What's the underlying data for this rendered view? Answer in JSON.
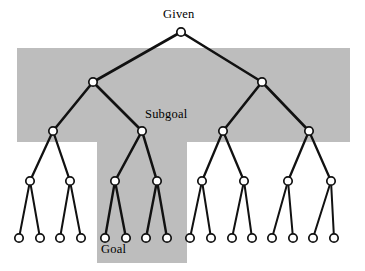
{
  "figure": {
    "title_alt": "Problem space search tree with Given, Subgoal and Goal highlighted",
    "width": 365,
    "height": 271,
    "background_color": "#ffffff"
  },
  "colors": {
    "highlight_fill": "#bdbdbd",
    "line": "#111111",
    "node_fill": "#ffffff",
    "node_stroke": "#111111",
    "text": "#000000"
  },
  "labels": {
    "given": "Given",
    "subgoal": "Subgoal",
    "goal": "Goal"
  },
  "highlight_regions": [
    {
      "name": "upper-band",
      "x": 17,
      "y": 48,
      "width": 333,
      "height": 94
    },
    {
      "name": "goal-column",
      "x": 97,
      "y": 142,
      "width": 90,
      "height": 121
    }
  ],
  "chart_data": {
    "type": "diagram",
    "diagram_kind": "binary-tree",
    "depth": 5,
    "node_counts_by_level": [
      1,
      2,
      4,
      8,
      16
    ],
    "node_radius": 4.2,
    "levels_y": [
      32,
      82,
      131,
      181,
      238
    ],
    "nodes": [
      {
        "id": "n0",
        "level": 0,
        "x": 181,
        "y": 32,
        "label": "Given",
        "highlight": false
      },
      {
        "id": "n1-0",
        "level": 1,
        "x": 93,
        "y": 82,
        "label": "",
        "highlight": false
      },
      {
        "id": "n1-1",
        "level": 1,
        "x": 262,
        "y": 82,
        "label": "",
        "highlight": false
      },
      {
        "id": "n2-0",
        "level": 2,
        "x": 53,
        "y": 131,
        "label": "",
        "highlight": false
      },
      {
        "id": "n2-1",
        "level": 2,
        "x": 142,
        "y": 131,
        "label": "Subgoal",
        "highlight": true
      },
      {
        "id": "n2-2",
        "level": 2,
        "x": 223,
        "y": 131,
        "label": "",
        "highlight": false
      },
      {
        "id": "n2-3",
        "level": 2,
        "x": 309,
        "y": 131,
        "label": "",
        "highlight": false
      },
      {
        "id": "n3-0",
        "level": 3,
        "x": 30,
        "y": 181,
        "label": "",
        "highlight": false
      },
      {
        "id": "n3-1",
        "level": 3,
        "x": 70,
        "y": 181,
        "label": "",
        "highlight": false
      },
      {
        "id": "n3-2",
        "level": 3,
        "x": 115,
        "y": 181,
        "label": "",
        "highlight": true
      },
      {
        "id": "n3-3",
        "level": 3,
        "x": 157,
        "y": 181,
        "label": "",
        "highlight": true
      },
      {
        "id": "n3-4",
        "level": 3,
        "x": 202,
        "y": 181,
        "label": "",
        "highlight": false
      },
      {
        "id": "n3-5",
        "level": 3,
        "x": 244,
        "y": 181,
        "label": "",
        "highlight": false
      },
      {
        "id": "n3-6",
        "level": 3,
        "x": 288,
        "y": 181,
        "label": "",
        "highlight": false
      },
      {
        "id": "n3-7",
        "level": 3,
        "x": 331,
        "y": 181,
        "label": "",
        "highlight": false
      },
      {
        "id": "n4-0",
        "level": 4,
        "x": 19,
        "y": 238,
        "label": "",
        "highlight": false
      },
      {
        "id": "n4-1",
        "level": 4,
        "x": 40,
        "y": 238,
        "label": "",
        "highlight": false
      },
      {
        "id": "n4-2",
        "level": 4,
        "x": 60,
        "y": 238,
        "label": "",
        "highlight": false
      },
      {
        "id": "n4-3",
        "level": 4,
        "x": 81,
        "y": 238,
        "label": "",
        "highlight": false
      },
      {
        "id": "n4-4",
        "level": 4,
        "x": 105,
        "y": 238,
        "label": "Goal",
        "highlight": true
      },
      {
        "id": "n4-5",
        "level": 4,
        "x": 126,
        "y": 238,
        "label": "",
        "highlight": true
      },
      {
        "id": "n4-6",
        "level": 4,
        "x": 146,
        "y": 238,
        "label": "",
        "highlight": true
      },
      {
        "id": "n4-7",
        "level": 4,
        "x": 167,
        "y": 238,
        "label": "",
        "highlight": true
      },
      {
        "id": "n4-8",
        "level": 4,
        "x": 190,
        "y": 238,
        "label": "",
        "highlight": false
      },
      {
        "id": "n4-9",
        "level": 4,
        "x": 211,
        "y": 238,
        "label": "",
        "highlight": false
      },
      {
        "id": "n4-10",
        "level": 4,
        "x": 232,
        "y": 238,
        "label": "",
        "highlight": false
      },
      {
        "id": "n4-11",
        "level": 4,
        "x": 252,
        "y": 238,
        "label": "",
        "highlight": false
      },
      {
        "id": "n4-12",
        "level": 4,
        "x": 272,
        "y": 238,
        "label": "",
        "highlight": false
      },
      {
        "id": "n4-13",
        "level": 4,
        "x": 293,
        "y": 238,
        "label": "",
        "highlight": false
      },
      {
        "id": "n4-14",
        "level": 4,
        "x": 313,
        "y": 238,
        "label": "",
        "highlight": false
      },
      {
        "id": "n4-15",
        "level": 4,
        "x": 334,
        "y": 238,
        "label": "",
        "highlight": false
      }
    ],
    "edges": [
      {
        "from": "n0",
        "to": "n1-0",
        "width": 2.6
      },
      {
        "from": "n0",
        "to": "n1-1",
        "width": 2.6
      },
      {
        "from": "n1-0",
        "to": "n2-0",
        "width": 2.6
      },
      {
        "from": "n1-0",
        "to": "n2-1",
        "width": 2.6
      },
      {
        "from": "n1-1",
        "to": "n2-2",
        "width": 2.6
      },
      {
        "from": "n1-1",
        "to": "n2-3",
        "width": 2.6
      },
      {
        "from": "n2-0",
        "to": "n3-0",
        "width": 2.3
      },
      {
        "from": "n2-0",
        "to": "n3-1",
        "width": 2.3
      },
      {
        "from": "n2-1",
        "to": "n3-2",
        "width": 2.6
      },
      {
        "from": "n2-1",
        "to": "n3-3",
        "width": 2.6
      },
      {
        "from": "n2-2",
        "to": "n3-4",
        "width": 2.3
      },
      {
        "from": "n2-2",
        "to": "n3-5",
        "width": 2.3
      },
      {
        "from": "n2-3",
        "to": "n3-6",
        "width": 2.3
      },
      {
        "from": "n2-3",
        "to": "n3-7",
        "width": 2.3
      },
      {
        "from": "n3-0",
        "to": "n4-0",
        "width": 2.0
      },
      {
        "from": "n3-0",
        "to": "n4-1",
        "width": 2.0
      },
      {
        "from": "n3-1",
        "to": "n4-2",
        "width": 2.0
      },
      {
        "from": "n3-1",
        "to": "n4-3",
        "width": 2.0
      },
      {
        "from": "n3-2",
        "to": "n4-4",
        "width": 2.4
      },
      {
        "from": "n3-2",
        "to": "n4-5",
        "width": 2.4
      },
      {
        "from": "n3-3",
        "to": "n4-6",
        "width": 2.4
      },
      {
        "from": "n3-3",
        "to": "n4-7",
        "width": 2.4
      },
      {
        "from": "n3-4",
        "to": "n4-8",
        "width": 2.0
      },
      {
        "from": "n3-4",
        "to": "n4-9",
        "width": 2.0
      },
      {
        "from": "n3-5",
        "to": "n4-10",
        "width": 2.0
      },
      {
        "from": "n3-5",
        "to": "n4-11",
        "width": 2.0
      },
      {
        "from": "n3-6",
        "to": "n4-12",
        "width": 2.0
      },
      {
        "from": "n3-6",
        "to": "n4-13",
        "width": 2.0
      },
      {
        "from": "n3-7",
        "to": "n4-14",
        "width": 2.0
      },
      {
        "from": "n3-7",
        "to": "n4-15",
        "width": 2.0
      }
    ]
  }
}
